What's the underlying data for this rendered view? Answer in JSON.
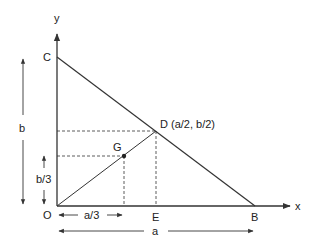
{
  "diagram": {
    "type": "geometry",
    "axes": {
      "x_label": "x",
      "y_label": "y"
    },
    "points": {
      "O": {
        "label": "O"
      },
      "B": {
        "label": "B"
      },
      "C": {
        "label": "C"
      },
      "D": {
        "label": "D (a/2, b/2)"
      },
      "E": {
        "label": "E"
      },
      "G": {
        "label": "G"
      }
    },
    "dimensions": {
      "a": "a",
      "b": "b",
      "a_third": "a/3",
      "b_third": "b/3"
    },
    "colors": {
      "stroke": "#333333",
      "text": "#222222"
    }
  }
}
